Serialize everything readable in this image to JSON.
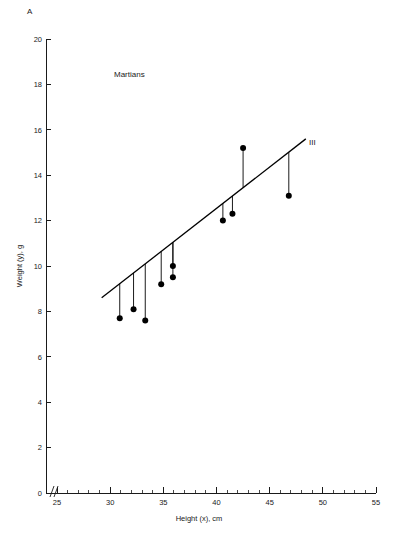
{
  "figure": {
    "panel_letter": "A",
    "group_label": "Martians",
    "line_id_label": "III"
  },
  "chart_data": {
    "type": "scatter",
    "title": "",
    "subtitle": "",
    "xlabel": "Height (x), cm",
    "ylabel": "Weight (y), g",
    "xlim": [
      25,
      55
    ],
    "ylim": [
      0,
      20
    ],
    "x_ticks": [
      25,
      30,
      35,
      40,
      45,
      50,
      55
    ],
    "x_tick_labels": [
      "25",
      "30",
      "35",
      "40",
      "45",
      "50",
      "55"
    ],
    "x_minor_tick_step": 1,
    "y_ticks": [
      0,
      2,
      4,
      6,
      8,
      10,
      12,
      14,
      16,
      18,
      20
    ],
    "y_tick_labels": [
      "0",
      "2",
      "4",
      "6",
      "8",
      "10",
      "12",
      "14",
      "16",
      "18",
      "20"
    ],
    "grid": false,
    "legend": "none",
    "axis_break": true,
    "annotations": [
      {
        "text": "A",
        "role": "panel-letter"
      },
      {
        "text": "Martians",
        "role": "group-label",
        "x": 32.5,
        "y": 17.9
      },
      {
        "text": "III",
        "role": "regression-line-label",
        "x": 49.5,
        "y": 15.6
      }
    ],
    "series": [
      {
        "name": "Martians",
        "type": "scatter",
        "marker": "filled-circle",
        "color": "#000000",
        "points": [
          {
            "x": 30.9,
            "y": 7.7
          },
          {
            "x": 32.2,
            "y": 8.1
          },
          {
            "x": 33.3,
            "y": 7.6
          },
          {
            "x": 34.8,
            "y": 9.2
          },
          {
            "x": 35.9,
            "y": 10.0
          },
          {
            "x": 35.9,
            "y": 9.5
          },
          {
            "x": 40.6,
            "y": 12.0
          },
          {
            "x": 41.5,
            "y": 12.3
          },
          {
            "x": 42.5,
            "y": 15.2
          },
          {
            "x": 46.8,
            "y": 13.1
          }
        ]
      },
      {
        "name": "Regression line III",
        "type": "line",
        "color": "#000000",
        "x_start": 29.2,
        "y_start": 8.6,
        "x_end": 48.4,
        "y_end": 15.6,
        "slope": 0.3646,
        "intercept": -2.047
      }
    ],
    "residuals": {
      "shown": true,
      "description": "vertical segments from each point to the regression line"
    }
  }
}
